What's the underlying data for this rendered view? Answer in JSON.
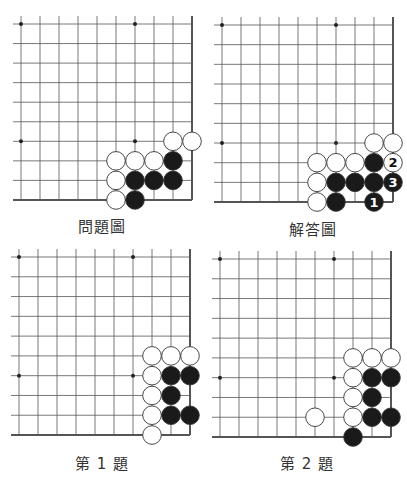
{
  "colors": {
    "grid": "#555555",
    "edge": "#444444",
    "black_stone": "#1a1a1a",
    "white_stone": "#ffffff",
    "stone_outline": "#333333",
    "caption": "#333333"
  },
  "boards": [
    {
      "id": "problem",
      "caption": "問題圖",
      "caption_pos": {
        "x": 78,
        "y": 215
      },
      "origin": {
        "x": 21,
        "y": 24
      },
      "dx": 19,
      "dy": 19.55,
      "stars": [
        [
          0,
          0
        ],
        [
          6,
          0
        ],
        [
          0,
          6
        ],
        [
          6,
          6
        ]
      ],
      "stones": [
        {
          "c": 8,
          "r": 6,
          "color": "white"
        },
        {
          "c": 9,
          "r": 6,
          "color": "white"
        },
        {
          "c": 5,
          "r": 7,
          "color": "white"
        },
        {
          "c": 6,
          "r": 7,
          "color": "white"
        },
        {
          "c": 7,
          "r": 7,
          "color": "white"
        },
        {
          "c": 8,
          "r": 7,
          "color": "black"
        },
        {
          "c": 5,
          "r": 8,
          "color": "white"
        },
        {
          "c": 6,
          "r": 8,
          "color": "black"
        },
        {
          "c": 7,
          "r": 8,
          "color": "black"
        },
        {
          "c": 8,
          "r": 8,
          "color": "black"
        },
        {
          "c": 5,
          "r": 9,
          "color": "white"
        },
        {
          "c": 6,
          "r": 9,
          "color": "black"
        }
      ]
    },
    {
      "id": "answer",
      "caption": "解答圖",
      "caption_pos": {
        "x": 289,
        "y": 218
      },
      "origin": {
        "x": 222,
        "y": 25
      },
      "dx": 19,
      "dy": 19.67,
      "stars": [
        [
          0,
          0
        ],
        [
          6,
          0
        ],
        [
          0,
          6
        ],
        [
          6,
          6
        ]
      ],
      "stones": [
        {
          "c": 8,
          "r": 6,
          "color": "white"
        },
        {
          "c": 9,
          "r": 6,
          "color": "white"
        },
        {
          "c": 5,
          "r": 7,
          "color": "white"
        },
        {
          "c": 6,
          "r": 7,
          "color": "white"
        },
        {
          "c": 7,
          "r": 7,
          "color": "white"
        },
        {
          "c": 8,
          "r": 7,
          "color": "black"
        },
        {
          "c": 9,
          "r": 7,
          "color": "white",
          "label": "2"
        },
        {
          "c": 5,
          "r": 8,
          "color": "white"
        },
        {
          "c": 6,
          "r": 8,
          "color": "black"
        },
        {
          "c": 7,
          "r": 8,
          "color": "black"
        },
        {
          "c": 8,
          "r": 8,
          "color": "black"
        },
        {
          "c": 9,
          "r": 8,
          "color": "black",
          "label": "3"
        },
        {
          "c": 5,
          "r": 9,
          "color": "white"
        },
        {
          "c": 6,
          "r": 9,
          "color": "black"
        },
        {
          "c": 8,
          "r": 9,
          "color": "black",
          "label": "1"
        }
      ]
    },
    {
      "id": "exercise-1",
      "caption": "第 1 題",
      "caption_pos": {
        "x": 75,
        "y": 452
      },
      "origin": {
        "x": 19,
        "y": 257
      },
      "dx": 19,
      "dy": 19.78,
      "stars": [
        [
          0,
          0
        ],
        [
          6,
          0
        ],
        [
          0,
          6
        ],
        [
          6,
          6
        ]
      ],
      "stones": [
        {
          "c": 7,
          "r": 5,
          "color": "white"
        },
        {
          "c": 8,
          "r": 5,
          "color": "white"
        },
        {
          "c": 9,
          "r": 5,
          "color": "white"
        },
        {
          "c": 7,
          "r": 6,
          "color": "white"
        },
        {
          "c": 8,
          "r": 6,
          "color": "black"
        },
        {
          "c": 9,
          "r": 6,
          "color": "black"
        },
        {
          "c": 7,
          "r": 7,
          "color": "white"
        },
        {
          "c": 8,
          "r": 7,
          "color": "black"
        },
        {
          "c": 7,
          "r": 8,
          "color": "white"
        },
        {
          "c": 8,
          "r": 8,
          "color": "black"
        },
        {
          "c": 9,
          "r": 8,
          "color": "black"
        },
        {
          "c": 7,
          "r": 9,
          "color": "white"
        }
      ]
    },
    {
      "id": "exercise-2",
      "caption": "第 2 題",
      "caption_pos": {
        "x": 280,
        "y": 452
      },
      "origin": {
        "x": 220,
        "y": 259
      },
      "dx": 19,
      "dy": 19.78,
      "stars": [
        [
          0,
          0
        ],
        [
          6,
          0
        ],
        [
          0,
          6
        ],
        [
          6,
          6
        ]
      ],
      "stones": [
        {
          "c": 7,
          "r": 5,
          "color": "white"
        },
        {
          "c": 8,
          "r": 5,
          "color": "white"
        },
        {
          "c": 9,
          "r": 5,
          "color": "white"
        },
        {
          "c": 7,
          "r": 6,
          "color": "white"
        },
        {
          "c": 8,
          "r": 6,
          "color": "black"
        },
        {
          "c": 9,
          "r": 6,
          "color": "black"
        },
        {
          "c": 7,
          "r": 7,
          "color": "white"
        },
        {
          "c": 8,
          "r": 7,
          "color": "black"
        },
        {
          "c": 5,
          "r": 8,
          "color": "white"
        },
        {
          "c": 7,
          "r": 8,
          "color": "white"
        },
        {
          "c": 8,
          "r": 8,
          "color": "black"
        },
        {
          "c": 9,
          "r": 8,
          "color": "black"
        },
        {
          "c": 7,
          "r": 9,
          "color": "black"
        }
      ]
    }
  ]
}
